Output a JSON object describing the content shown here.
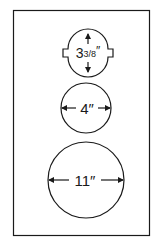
{
  "diagram": {
    "shapes": [
      {
        "name": "notched-circle",
        "label": "3⅜″",
        "label_main": "3",
        "label_frac": "3/8",
        "label_unit": "″",
        "dimension": "3 3/8 inches",
        "arrow_direction": "vertical"
      },
      {
        "name": "medium-circle",
        "label": "4″",
        "dimension": "4 inches",
        "arrow_direction": "horizontal"
      },
      {
        "name": "large-circle",
        "label": "11″",
        "dimension": "11 inches",
        "arrow_direction": "horizontal"
      }
    ],
    "colors": {
      "stroke": "#1a1a1a",
      "background": "#ffffff"
    }
  }
}
